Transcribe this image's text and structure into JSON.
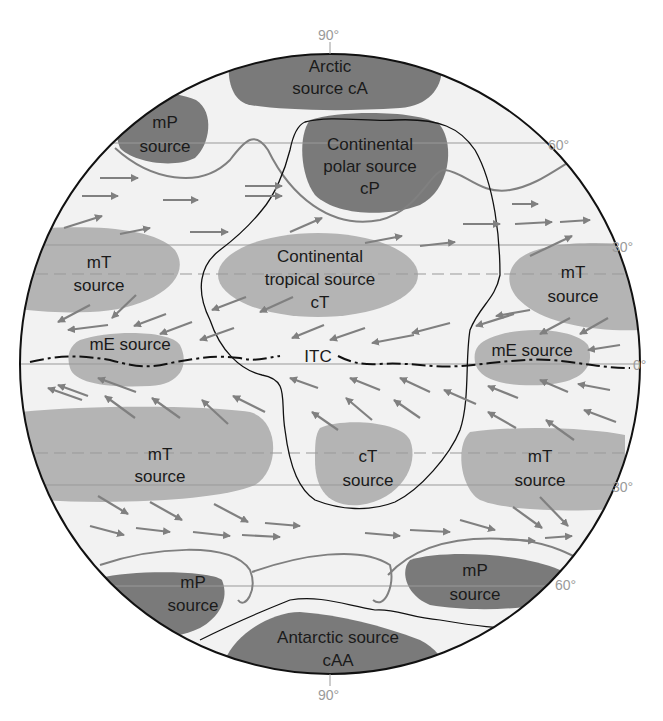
{
  "diagram": {
    "colors": {
      "background": "#f2f2f2",
      "outline": "#111111",
      "polar_source": "#7a7a7a",
      "tropical_source": "#b4b4b4",
      "arrows": "#808080",
      "front": "#808080",
      "latitude_line": "#999999",
      "degree_label": "#9a9a9a"
    },
    "latitude_labels": {
      "north_pole": "90°",
      "n60": "60°",
      "n30": "30°",
      "equator": "0°",
      "s30": "30°",
      "s60": "60°",
      "south_pole": "90°"
    },
    "sources": {
      "arctic": {
        "line1": "Arctic",
        "line2": "source cA"
      },
      "mp_nw": {
        "line1": "mP",
        "line2": "source"
      },
      "cp": {
        "line1": "Continental",
        "line2": "polar source",
        "line3": "cP"
      },
      "mt_nw": {
        "line1": "mT",
        "line2": "source"
      },
      "ct_north": {
        "line1": "Continental",
        "line2": "tropical source",
        "line3": "cT"
      },
      "mt_ne": {
        "line1": "mT",
        "line2": "source"
      },
      "me_west": {
        "line1": "mE source"
      },
      "me_east": {
        "line1": "mE source"
      },
      "itc": {
        "label": "ITC"
      },
      "mt_sw": {
        "line1": "mT",
        "line2": "source"
      },
      "ct_south": {
        "line1": "cT",
        "line2": "source"
      },
      "mt_se": {
        "line1": "mT",
        "line2": "source"
      },
      "mp_sw": {
        "line1": "mP",
        "line2": "source"
      },
      "mp_se": {
        "line1": "mP",
        "line2": "source"
      },
      "antarctic": {
        "line1": "Antarctic source",
        "line2": "cAA"
      }
    }
  }
}
